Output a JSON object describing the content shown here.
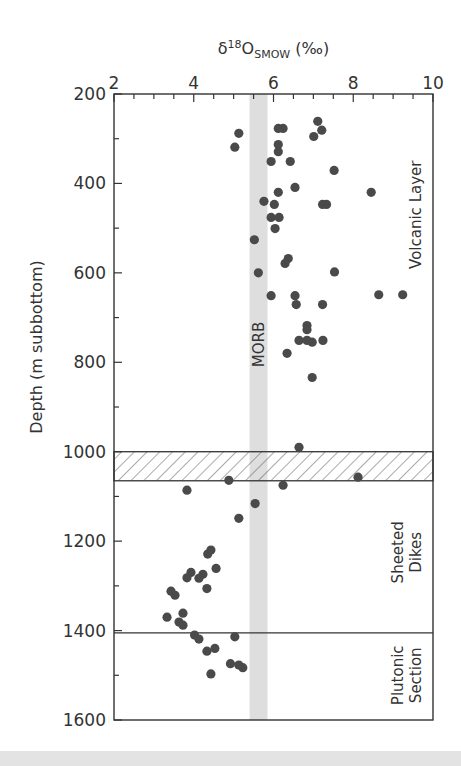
{
  "chart_data": {
    "type": "scatter",
    "title": "",
    "xlabel": "δ18O SMOW (‰)",
    "xlabel_parts": {
      "delta": "δ",
      "sup": "18",
      "base": "O",
      "sub": "SMOW",
      "unit": " (‰)"
    },
    "ylabel": "Depth (m subbottom)",
    "xlim": [
      2,
      10
    ],
    "ylim": [
      200,
      1600
    ],
    "y_inverted": true,
    "x_axis_position": "top",
    "x_ticks": [
      2,
      4,
      6,
      8,
      10
    ],
    "x_minor_step": 0.5,
    "y_ticks": [
      200,
      400,
      600,
      800,
      1000,
      1200,
      1400,
      1600
    ],
    "y_minor_step": 100,
    "grid": false,
    "marker_color": "#4a4a4a",
    "band": {
      "label": "MORB",
      "x_range": [
        5.4,
        5.85
      ],
      "color": "#dedede"
    },
    "hatched_zone": {
      "depth_range": [
        1000,
        1065
      ]
    },
    "boundary_lines": [
      1405
    ],
    "zone_labels": [
      {
        "lines": [
          "Volcanic Layer"
        ],
        "depth_center": 470
      },
      {
        "lines": [
          "Sheeted",
          "Dikes"
        ],
        "depth_center": 1225
      },
      {
        "lines": [
          "Plutonic",
          "Section"
        ],
        "depth_center": 1500
      }
    ],
    "series": [
      {
        "name": "samples",
        "points": [
          [
            5.13,
            288
          ],
          [
            5.03,
            319
          ],
          [
            6.12,
            277
          ],
          [
            6.24,
            277
          ],
          [
            7.11,
            261
          ],
          [
            7.21,
            281
          ],
          [
            7.01,
            295
          ],
          [
            6.12,
            313
          ],
          [
            6.12,
            329
          ],
          [
            5.94,
            351
          ],
          [
            6.42,
            351
          ],
          [
            7.52,
            371
          ],
          [
            6.54,
            409
          ],
          [
            6.12,
            420
          ],
          [
            8.45,
            420
          ],
          [
            5.76,
            440
          ],
          [
            6.02,
            447
          ],
          [
            7.23,
            447
          ],
          [
            7.33,
            447
          ],
          [
            5.94,
            476
          ],
          [
            6.14,
            476
          ],
          [
            6.04,
            501
          ],
          [
            5.52,
            526
          ],
          [
            6.37,
            568
          ],
          [
            6.29,
            579
          ],
          [
            5.62,
            600
          ],
          [
            7.53,
            598
          ],
          [
            5.94,
            651
          ],
          [
            6.54,
            651
          ],
          [
            8.64,
            649
          ],
          [
            9.24,
            649
          ],
          [
            6.57,
            671
          ],
          [
            7.23,
            671
          ],
          [
            6.84,
            718
          ],
          [
            6.84,
            727
          ],
          [
            6.64,
            751
          ],
          [
            6.84,
            751
          ],
          [
            6.97,
            755
          ],
          [
            7.24,
            751
          ],
          [
            6.34,
            780
          ],
          [
            6.97,
            834
          ],
          [
            6.64,
            990
          ],
          [
            6.24,
            1075
          ],
          [
            8.12,
            1057
          ],
          [
            4.88,
            1064
          ],
          [
            3.83,
            1086
          ],
          [
            5.54,
            1116
          ],
          [
            5.13,
            1149
          ],
          [
            4.43,
            1220
          ],
          [
            4.35,
            1229
          ],
          [
            4.56,
            1261
          ],
          [
            3.93,
            1270
          ],
          [
            3.83,
            1282
          ],
          [
            4.23,
            1274
          ],
          [
            4.13,
            1283
          ],
          [
            4.33,
            1306
          ],
          [
            3.43,
            1312
          ],
          [
            3.53,
            1321
          ],
          [
            3.73,
            1361
          ],
          [
            3.33,
            1370
          ],
          [
            3.63,
            1381
          ],
          [
            3.73,
            1388
          ],
          [
            4.02,
            1410
          ],
          [
            4.13,
            1419
          ],
          [
            5.03,
            1414
          ],
          [
            4.33,
            1446
          ],
          [
            4.53,
            1440
          ],
          [
            4.92,
            1474
          ],
          [
            5.13,
            1477
          ],
          [
            5.23,
            1483
          ],
          [
            4.43,
            1497
          ]
        ]
      }
    ]
  }
}
